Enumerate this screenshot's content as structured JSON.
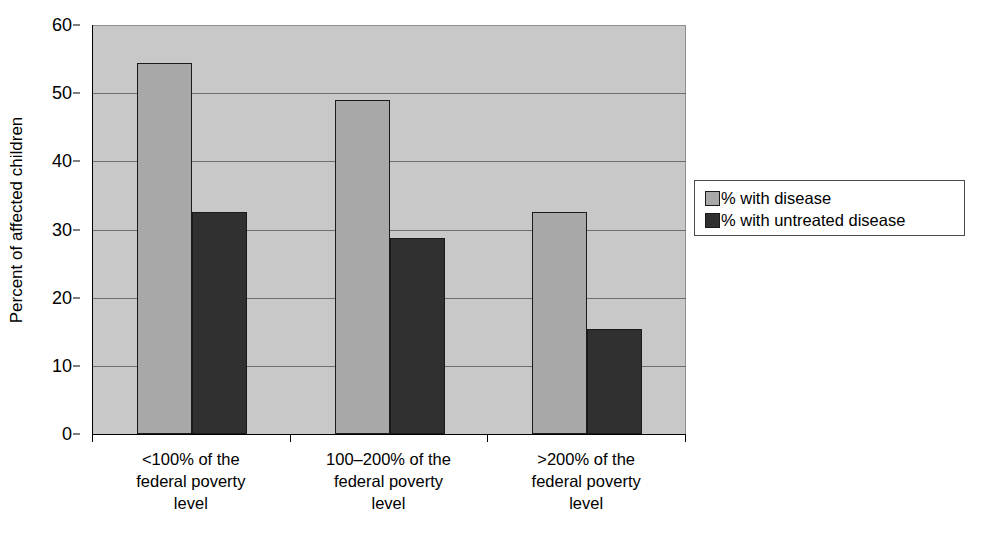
{
  "chart_data": {
    "type": "bar",
    "title": "",
    "subtitle": "",
    "xlabel": "",
    "ylabel": "Percent of affected children",
    "ylim": [
      0,
      60
    ],
    "yticks": [
      0,
      10,
      20,
      30,
      40,
      50,
      60
    ],
    "ytick_labels": [
      "0",
      "10",
      "20",
      "30",
      "40",
      "50",
      "60"
    ],
    "grid": true,
    "legend_position": "right",
    "categories": [
      "<100% of the federal poverty level",
      "100–200% of the federal poverty level",
      ">200% of the federal poverty level"
    ],
    "category_label_lines": [
      [
        "<100% of the",
        "federal poverty",
        "level"
      ],
      [
        "100–200% of the",
        "federal poverty",
        "level"
      ],
      [
        ">200% of the",
        "federal poverty",
        "level"
      ]
    ],
    "series": [
      {
        "name": "% with disease",
        "color": "#a8a8a8",
        "values": [
          54.5,
          49.0,
          32.6
        ]
      },
      {
        "name": "% with untreated disease",
        "color": "#303030",
        "values": [
          32.6,
          28.7,
          15.4
        ]
      }
    ],
    "colors": {
      "plot_background": "#c8c8c8",
      "page_background": "#ffffff",
      "gridline": "#6d6d6d",
      "axis": "#000000",
      "bar_light": "#a8a8a8",
      "bar_dark": "#303030"
    }
  },
  "legend": {
    "entries": [
      {
        "label": "% with disease",
        "color": "#a8a8a8"
      },
      {
        "label": "% with untreated disease",
        "color": "#303030"
      }
    ]
  }
}
